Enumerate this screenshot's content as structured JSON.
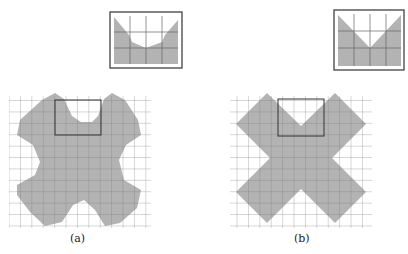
{
  "panels": [
    {
      "id": "a",
      "caption": "(a)",
      "shape": "rounded-cross",
      "inset": "curved-notch"
    },
    {
      "id": "b",
      "caption": "(b)",
      "shape": "sharp-x",
      "inset": "v-notch"
    }
  ],
  "colors": {
    "fill": "#b3b3b3",
    "grid": "#666666",
    "frame": "#333333"
  }
}
